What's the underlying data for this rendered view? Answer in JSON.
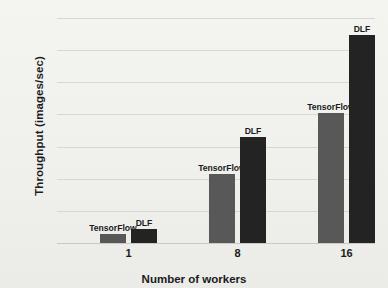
{
  "chart_data": {
    "type": "bar",
    "title": "",
    "xlabel": "Number of workers",
    "ylabel": "Throughput (images/sec)",
    "categories": [
      "1",
      "8",
      "16"
    ],
    "ylim": [
      0,
      3500
    ],
    "yticks": [
      0,
      500,
      1000,
      1500,
      2000,
      2500,
      3000,
      3500
    ],
    "ytick_labels": [
      "0",
      "500",
      "1000",
      "1500",
      "2000",
      "2500",
      "3000",
      "3500"
    ],
    "grid": true,
    "legend": "none",
    "series": [
      {
        "name": "TensorFlow",
        "color": "#585858",
        "values": [
          140,
          1075,
          2025
        ],
        "point_labels": [
          "TensorFlow",
          "TensorFlow",
          "TensorFlow"
        ]
      },
      {
        "name": "DLF",
        "color": "#232323",
        "values": [
          220,
          1650,
          3235
        ],
        "point_labels": [
          "DLF",
          "DLF",
          "DLF"
        ]
      }
    ],
    "annotations": [
      {
        "text": "TensorFlow",
        "category": "1",
        "series": "TensorFlow"
      },
      {
        "text": "DLF",
        "category": "1",
        "series": "DLF"
      },
      {
        "text": "TensorFlow",
        "category": "8",
        "series": "TensorFlow"
      },
      {
        "text": "DLF",
        "category": "8",
        "series": "DLF"
      },
      {
        "text": "TensorFlow",
        "category": "16",
        "series": "TensorFlow"
      },
      {
        "text": "DLF",
        "category": "16",
        "series": "DLF"
      }
    ],
    "colors": {
      "background": "#f2f2ef",
      "gridline": "#d7d7d4",
      "text": "#1b1b1b"
    }
  }
}
